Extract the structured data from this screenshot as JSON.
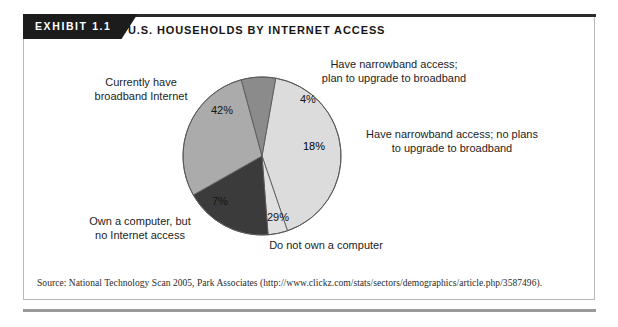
{
  "exhibit": {
    "tab_label": "EXHIBIT 1.1",
    "title": "U.S. HOUSEHOLDS BY INTERNET ACCESS",
    "source": "Source: National Technology Scan 2005, Park Associates (http://www.clickz.com/stats/sectors/demographics/article.php/3587496)."
  },
  "labels": {
    "broadband_line1": "Currently have",
    "broadband_line2": "broadband Internet",
    "narrowband_plan_line1": "Have narrowband access;",
    "narrowband_plan_line2": "plan to upgrade to broadband",
    "narrowband_noplan_line1": "Have narrowband access; no plans",
    "narrowband_noplan_line2": "to upgrade to broadband",
    "own_computer_line1": "Own a computer, but",
    "own_computer_line2": "no Internet access",
    "no_computer": "Do not own a computer"
  },
  "percent_labels": {
    "broadband": "42%",
    "narrowband_plan": "4%",
    "narrowband_noplan": "18%",
    "own_computer": "7%",
    "no_computer": "29%"
  },
  "chart_data": {
    "type": "pie",
    "title": "U.S. HOUSEHOLDS BY INTERNET ACCESS",
    "xlabel": "",
    "ylabel": "",
    "legend": "none",
    "grid": false,
    "units": "percent of U.S. households",
    "start_angle_deg": -80,
    "direction": "clockwise",
    "categories": [
      "Currently have broadband Internet",
      "Have narrowband access; plan to upgrade to broadband",
      "Have narrowband access; no plans to upgrade to broadband",
      "Do not own a computer",
      "Own a computer, but no Internet access"
    ],
    "values": [
      42,
      4,
      18,
      29,
      7
    ],
    "labels": [
      "42%",
      "4%",
      "18%",
      "29%",
      "7%"
    ],
    "colors": [
      "#dcdcdc",
      "#e0e0e0",
      "#3b3b3b",
      "#ababab",
      "#8b8b8b"
    ],
    "slice_outline": "#5a5a5a",
    "total": 100
  },
  "geometry": {
    "cx": 262,
    "cy": 156,
    "r": 79
  },
  "colors": {
    "tab_background": "#1c1c1c",
    "tab_text": "#ffffff",
    "frame_border": "#b9b9b9",
    "top_rule": "#2b2b2b",
    "bottom_rule": "#9a9a9a",
    "text": "#1d1d1d"
  }
}
